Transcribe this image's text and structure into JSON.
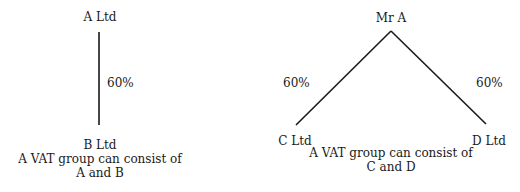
{
  "diagram_left": {
    "parent": "A Ltd",
    "child": "B Ltd",
    "ownership": "60%",
    "caption_line1": "A VAT group can consist of",
    "caption_line2": "A and B"
  },
  "diagram_right": {
    "parent": "Mr A",
    "child_left": "C Ltd",
    "child_right": "D Ltd",
    "ownership_left": "60%",
    "ownership_right": "60%",
    "caption_line1": "A VAT group can consist of",
    "caption_line2": "C and D"
  },
  "colors": {
    "line": "#1a1a1a",
    "text": "#1a1a1a",
    "background": "#ffffff"
  }
}
